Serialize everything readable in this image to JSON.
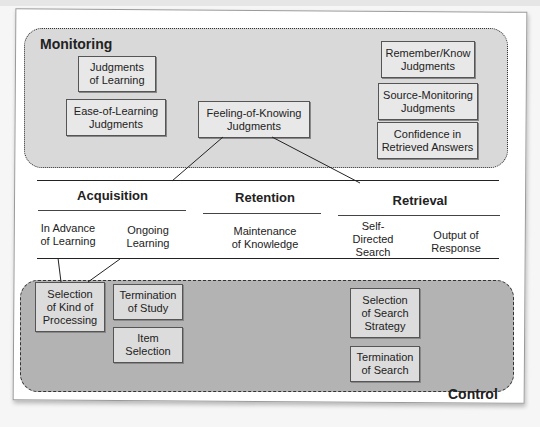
{
  "monitoring": {
    "label": "Monitoring",
    "boxes": [
      {
        "id": "jol",
        "text": "Judgments\nof Learning"
      },
      {
        "id": "eol",
        "text": "Ease-of-Learning\nJudgments"
      },
      {
        "id": "fok",
        "text": "Feeling-of-Knowing\nJudgments"
      },
      {
        "id": "rk",
        "text": "Remember/Know\nJudgments"
      },
      {
        "id": "sm",
        "text": "Source-Monitoring\nJudgments"
      },
      {
        "id": "conf",
        "text": "Confidence in\nRetrieved Answers"
      }
    ]
  },
  "phases": [
    {
      "label": "Acquisition",
      "subs": [
        "In Advance\nof Learning",
        "Ongoing\nLearning"
      ]
    },
    {
      "label": "Retention",
      "subs": [
        "Maintenance\nof Knowledge"
      ]
    },
    {
      "label": "Retrieval",
      "subs": [
        "Self-\nDirected\nSearch",
        "Output of\nResponse"
      ]
    }
  ],
  "control": {
    "label": "Control",
    "boxes": [
      {
        "id": "skp",
        "text": "Selection\nof Kind of\nProcessing"
      },
      {
        "id": "tos",
        "text": "Termination\nof Study"
      },
      {
        "id": "is",
        "text": "Item\nSelection"
      },
      {
        "id": "sss",
        "text": "Selection\nof Search\nStrategy"
      },
      {
        "id": "tsearch",
        "text": "Termination\nof Search"
      }
    ]
  }
}
